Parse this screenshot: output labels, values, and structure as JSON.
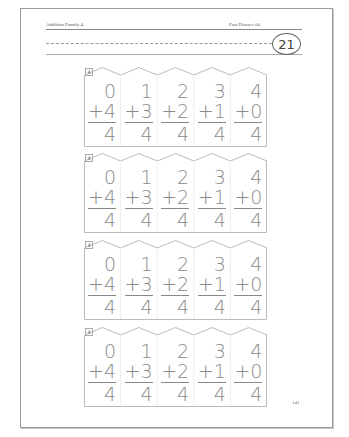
{
  "header": {
    "left": "Addition Family 4",
    "right": "Fact Houses #4",
    "page_badge": "21"
  },
  "houses": [
    {
      "tag": "4",
      "facts": [
        {
          "a": "0",
          "b": "+4",
          "s": "4"
        },
        {
          "a": "1",
          "b": "+3",
          "s": "4"
        },
        {
          "a": "2",
          "b": "+2",
          "s": "4"
        },
        {
          "a": "3",
          "b": "+1",
          "s": "4"
        },
        {
          "a": "4",
          "b": "+0",
          "s": "4"
        }
      ]
    },
    {
      "tag": "4",
      "facts": [
        {
          "a": "0",
          "b": "+4",
          "s": "4"
        },
        {
          "a": "1",
          "b": "+3",
          "s": "4"
        },
        {
          "a": "2",
          "b": "+2",
          "s": "4"
        },
        {
          "a": "3",
          "b": "+1",
          "s": "4"
        },
        {
          "a": "4",
          "b": "+0",
          "s": "4"
        }
      ]
    },
    {
      "tag": "4",
      "facts": [
        {
          "a": "0",
          "b": "+4",
          "s": "4"
        },
        {
          "a": "1",
          "b": "+3",
          "s": "4"
        },
        {
          "a": "2",
          "b": "+2",
          "s": "4"
        },
        {
          "a": "3",
          "b": "+1",
          "s": "4"
        },
        {
          "a": "4",
          "b": "+0",
          "s": "4"
        }
      ]
    },
    {
      "tag": "4",
      "facts": [
        {
          "a": "0",
          "b": "+4",
          "s": "4"
        },
        {
          "a": "1",
          "b": "+3",
          "s": "4"
        },
        {
          "a": "2",
          "b": "+2",
          "s": "4"
        },
        {
          "a": "3",
          "b": "+1",
          "s": "4"
        },
        {
          "a": "4",
          "b": "+0",
          "s": "4"
        }
      ]
    }
  ],
  "footer": {
    "page_number": "141"
  }
}
